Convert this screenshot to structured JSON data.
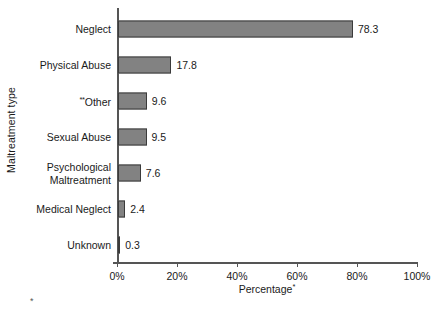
{
  "chart_data": {
    "type": "bar",
    "orientation": "horizontal",
    "title": "",
    "xlabel": "Percentage",
    "xlabel_note": "*",
    "ylabel": "Maltreatment type",
    "xlim": [
      0,
      100
    ],
    "grid": false,
    "legend": null,
    "categories": [
      "Neglect",
      "Physical Abuse",
      "Other",
      "Sexual Abuse",
      "Psychological Maltreatment",
      "Medical Neglect",
      "Unknown"
    ],
    "values": [
      78.3,
      17.8,
      9.6,
      9.5,
      7.6,
      2.4,
      0.3
    ],
    "value_labels": [
      "78.3",
      "17.8",
      "9.6",
      "9.5",
      "7.6",
      "2.4",
      "0.3"
    ],
    "category_notes": [
      "",
      "",
      "**",
      "",
      "",
      "",
      ""
    ],
    "category_label_lines": [
      [
        "Neglect"
      ],
      [
        "Physical Abuse"
      ],
      [
        "Other"
      ],
      [
        "Sexual Abuse"
      ],
      [
        "Psychological",
        "Maltreatment"
      ],
      [
        "Medical Neglect"
      ],
      [
        "Unknown"
      ]
    ],
    "xticks": [
      0,
      20,
      40,
      60,
      80,
      100
    ],
    "xtick_labels": [
      "0%",
      "20%",
      "40%",
      "60%",
      "80%",
      "100%"
    ],
    "bar_fill_color": "#828282",
    "bar_border_color": "#3b3b3b",
    "axis_color": "#555555",
    "text_color": "#1a1a1a",
    "background_color": "#ffffff",
    "footnote_mark": "*"
  }
}
